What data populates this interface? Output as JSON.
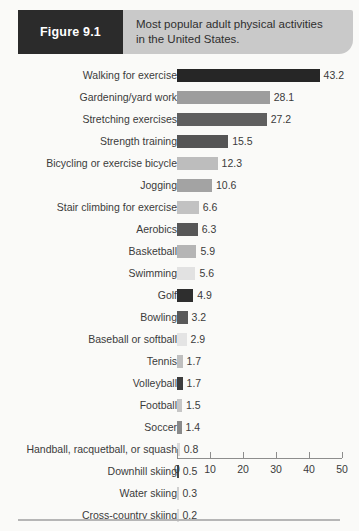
{
  "banner": {
    "figure_tab_label": "Figure 9.1",
    "title_line_1": "Most popular adult physical activities",
    "title_line_2": "in the United States.",
    "tab_background": "#2b2b2b",
    "banner_background": "#c9c9c9"
  },
  "chart_data": {
    "type": "bar",
    "orientation": "horizontal",
    "title": "Most popular adult physical activities in the United States.",
    "xlabel": "",
    "ylabel": "",
    "xlim": [
      0,
      50
    ],
    "xticks": [
      0,
      10,
      20,
      30,
      40,
      50
    ],
    "xtick_labels": [
      "0",
      "10",
      "20",
      "30",
      "40",
      "50"
    ],
    "grid": false,
    "legend": "none",
    "categories": [
      "Walking for exercise",
      "Gardening/yard work",
      "Stretching exercises",
      "Strength training",
      "Bicycling or exercise bicycle",
      "Jogging",
      "Stair climbing for exercise",
      "Aerobics",
      "Basketball",
      "Swimming",
      "Golf",
      "Bowling",
      "Baseball or softball",
      "Tennis",
      "Volleyball",
      "Football",
      "Soccer",
      "Handball, racquetball, or squash",
      "Downhill skiing",
      "Water skiing",
      "Cross-country skiing"
    ],
    "values": [
      43.2,
      28.1,
      27.2,
      15.5,
      12.3,
      10.6,
      6.6,
      6.3,
      5.9,
      5.6,
      4.9,
      3.2,
      2.9,
      1.7,
      1.7,
      1.5,
      1.4,
      0.8,
      0.5,
      0.3,
      0.2
    ],
    "value_labels": [
      "43.2",
      "28.1",
      "27.2",
      "15.5",
      "12.3",
      "10.6",
      "6.6",
      "6.3",
      "5.9",
      "5.6",
      "4.9",
      "3.2",
      "2.9",
      "1.7",
      "1.7",
      "1.5",
      "1.4",
      "0.8",
      "0.5",
      "0.3",
      "0.2"
    ],
    "bar_colors": [
      "#262626",
      "#9d9d9d",
      "#5f5f5f",
      "#555555",
      "#bdbdbd",
      "#a3a3a3",
      "#c2c2c2",
      "#575757",
      "#b5b5b5",
      "#e2e2e2",
      "#2e2e2e",
      "#595959",
      "#e4e4e4",
      "#bfbfbf",
      "#3d3d3d",
      "#c6c6c6",
      "#8a8a8a",
      "#d9d9d9",
      "#4a4a4a",
      "#cfcfcf",
      "#dadada"
    ]
  }
}
